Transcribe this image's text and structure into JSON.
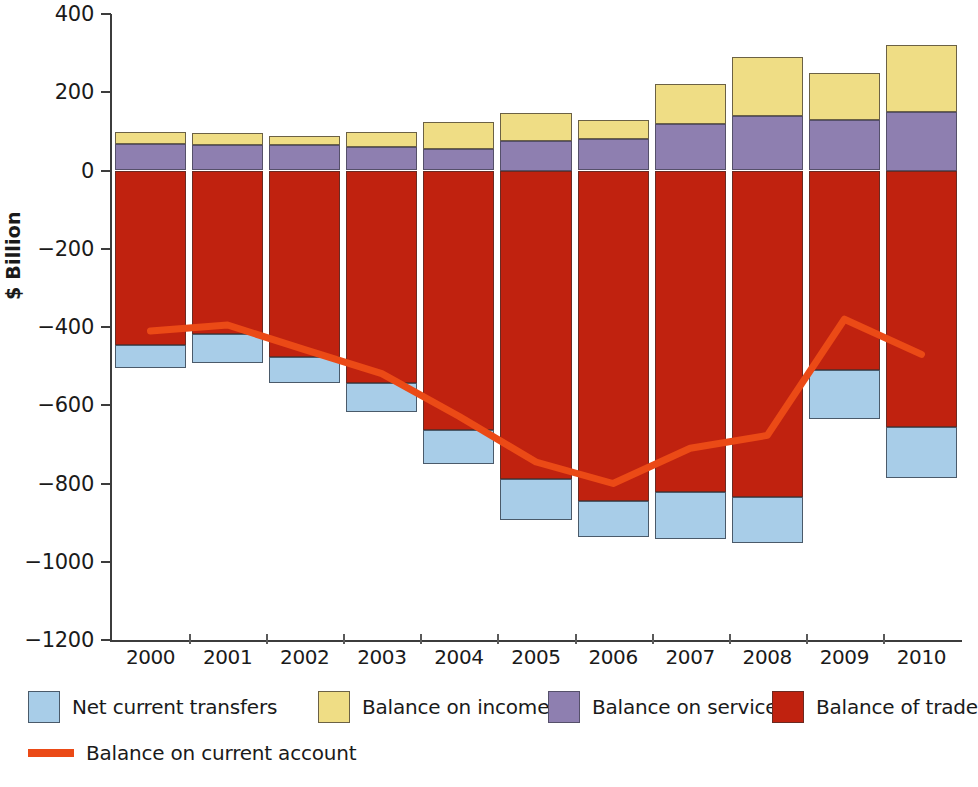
{
  "chart_data": {
    "type": "bar",
    "title": "",
    "subtitle": "",
    "xlabel": "",
    "ylabel": "$ Billion",
    "ylim": [
      -1200,
      400
    ],
    "yticks": [
      400,
      200,
      0,
      -200,
      -400,
      -600,
      -800,
      -1000,
      -1200
    ],
    "ytick_labels": [
      "400",
      "200",
      "0",
      "−200",
      "−400",
      "−600",
      "−800",
      "−1000",
      "−1200"
    ],
    "grid": false,
    "stacked": true,
    "legend_position": "bottom",
    "categories": [
      "2000",
      "2001",
      "2002",
      "2003",
      "2004",
      "2005",
      "2006",
      "2007",
      "2008",
      "2009",
      "2010"
    ],
    "series": [
      {
        "name": "Net current transfers",
        "color": "#a8cde8",
        "values": [
          -61,
          -73,
          -66,
          -74,
          -87,
          -105,
          -92,
          -120,
          -118,
          -125,
          -130
        ]
      },
      {
        "name": "Balance on income",
        "color": "#efdd85",
        "values": [
          31,
          30,
          25,
          38,
          70,
          72,
          48,
          100,
          150,
          120,
          170
        ]
      },
      {
        "name": "Balance on services",
        "color": "#8e7fb0",
        "values": [
          68,
          65,
          64,
          60,
          55,
          75,
          80,
          120,
          140,
          130,
          150
        ]
      },
      {
        "name": "Balance of trade",
        "color": "#c0220f",
        "values": [
          -445,
          -418,
          -476,
          -543,
          -663,
          -788,
          -845,
          -822,
          -835,
          -510,
          -655
        ]
      }
    ],
    "line_series": {
      "name": "Balance on current account",
      "color": "#eb4a16",
      "values": [
        -410,
        -395,
        -458,
        -519,
        -628,
        -745,
        -800,
        -710,
        -677,
        -380,
        -470
      ]
    }
  },
  "axis": {
    "ylabel": "$ Billion"
  },
  "legend": {
    "items": [
      {
        "label": "Net current transfers",
        "swatch": "transfers",
        "kind": "box"
      },
      {
        "label": "Balance on income",
        "swatch": "income",
        "kind": "box"
      },
      {
        "label": "Balance on services",
        "swatch": "services",
        "kind": "box"
      },
      {
        "label": "Balance of trade",
        "swatch": "trade",
        "kind": "box"
      },
      {
        "label": "Balance on current account",
        "swatch": "line",
        "kind": "line"
      }
    ]
  },
  "colors": {
    "transfers": "#a8cde8",
    "income": "#efdd85",
    "services": "#8e7fb0",
    "trade": "#c0220f",
    "current_account_line": "#eb4a16",
    "axis": "#3c3c3c",
    "background": "#ffffff"
  }
}
